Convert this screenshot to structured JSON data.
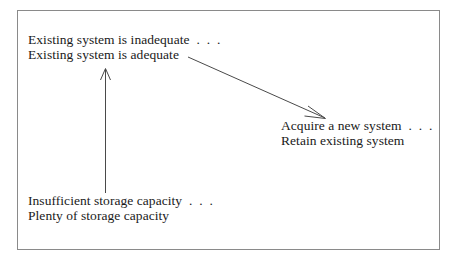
{
  "figure": {
    "background_color": "#ffffff",
    "frame_color": "#8a8a8a",
    "text_color": "#1a1a1a",
    "arrow_color": "#4a4a4a",
    "blocks": {
      "existing_system": {
        "line1": "Existing system is inadequate  .  .  .",
        "line2": "Existing system is adequate"
      },
      "acquire_system": {
        "line1": "Acquire a new system  .  .  .",
        "line2": "Retain existing system"
      },
      "storage_capacity": {
        "line1": "Insufficient storage capacity  .  .  .",
        "line2": "Plenty of storage capacity"
      }
    },
    "arrows": {
      "vertical": {
        "name": "storage-to-existing-system-arrow",
        "from": "storage_capacity",
        "to": "existing_system",
        "direction": "up"
      },
      "diagonal": {
        "name": "existing-system-to-acquire-arrow",
        "from": "existing_system",
        "to": "acquire_system",
        "direction": "down-right"
      }
    }
  }
}
